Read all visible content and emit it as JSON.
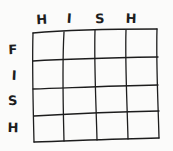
{
  "figure": {
    "kind": "hand-drawn-grid-sketch",
    "background_color": "#fbfbfa",
    "ink_color": "#1d1d1d",
    "rows": 4,
    "columns": 4
  },
  "column_labels": [
    {
      "text": "H",
      "x": 42,
      "y": 24
    },
    {
      "text": "I",
      "x": 69,
      "y": 23
    },
    {
      "text": "S",
      "x": 100,
      "y": 23
    },
    {
      "text": "H",
      "x": 131,
      "y": 23
    }
  ],
  "row_labels": [
    {
      "text": "F",
      "x": 13,
      "y": 54
    },
    {
      "text": "I",
      "x": 14,
      "y": 80
    },
    {
      "text": "S",
      "x": 13,
      "y": 105
    },
    {
      "text": "H",
      "x": 13,
      "y": 132
    }
  ],
  "grid_paths": {
    "horizontal": [
      "M33,33 C 66,30 98,29 157,29",
      "M33,61 C 66,59 100,58 158,57",
      "M33,89 C 68,88 104,86 158,85",
      "M34,116 C 68,114 104,112 159,111",
      "M34,142 C 70,141 108,139 159,138"
    ],
    "vertical": [
      "M33,33 C 32,66 33,100 34,142",
      "M64,32 C 62,66 63,101 64,141",
      "M95,30 C 94,65 96,100 97,140",
      "M126,30 C 125,64 127,99 128,139",
      "M157,29 C 156,64 158,99 159,138"
    ]
  }
}
